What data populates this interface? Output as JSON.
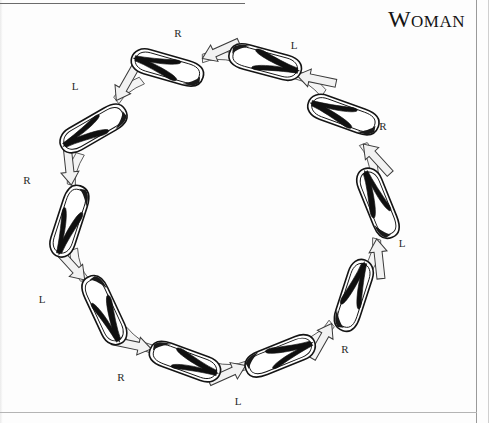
{
  "page": {
    "title": "Woman",
    "title_text": "Woman",
    "background_color": "#fdfdfd",
    "ink_color": "#111111"
  },
  "diagram": {
    "type": "cycle-of-footprints",
    "center": {
      "x": 224,
      "y": 212
    },
    "radius": 155,
    "arrow_direction": "counter-clockwise",
    "step_count": 10,
    "steps": [
      {
        "index": 0,
        "label": "R",
        "angle_deg": -75,
        "shoe_rot_deg": 15,
        "label_x": 178,
        "label_y": 33
      },
      {
        "index": 1,
        "label": "L",
        "angle_deg": -39,
        "shoe_rot_deg": 200,
        "label_x": 294,
        "label_y": 45
      },
      {
        "index": 2,
        "label": "R",
        "angle_deg": -3,
        "shoe_rot_deg": 248,
        "label_x": 383,
        "label_y": 126
      },
      {
        "index": 3,
        "label": "L",
        "angle_deg": 33,
        "shoe_rot_deg": 288,
        "label_x": 402,
        "label_y": 243
      },
      {
        "index": 4,
        "label": "R",
        "angle_deg": 69,
        "shoe_rot_deg": 338,
        "label_x": 345,
        "label_y": 349
      },
      {
        "index": 5,
        "label": "L",
        "angle_deg": 105,
        "shoe_rot_deg": 20,
        "label_x": 238,
        "label_y": 401
      },
      {
        "index": 6,
        "label": "R",
        "angle_deg": 141,
        "shoe_rot_deg": 65,
        "label_x": 121,
        "label_y": 377
      },
      {
        "index": 7,
        "label": "L",
        "angle_deg": 177,
        "shoe_rot_deg": 108,
        "label_x": 42,
        "label_y": 299
      },
      {
        "index": 8,
        "label": "R",
        "angle_deg": 213,
        "shoe_rot_deg": 150,
        "label_x": 27,
        "label_y": 180
      },
      {
        "index": 9,
        "label": "L",
        "angle_deg": 249,
        "shoe_rot_deg": 196,
        "label_x": 75,
        "label_y": 86
      }
    ],
    "labels_sequence": [
      "R",
      "L",
      "R",
      "L",
      "R",
      "L",
      "R",
      "L",
      "R",
      "L"
    ]
  },
  "chart_data": {
    "type": "diagram",
    "title": "Woman",
    "categories": [
      "R",
      "L",
      "R",
      "L",
      "R",
      "L",
      "R",
      "L",
      "R",
      "L"
    ],
    "values": [
      1,
      2,
      3,
      4,
      5,
      6,
      7,
      8,
      9,
      10
    ],
    "xlabel": "",
    "ylabel": ""
  }
}
